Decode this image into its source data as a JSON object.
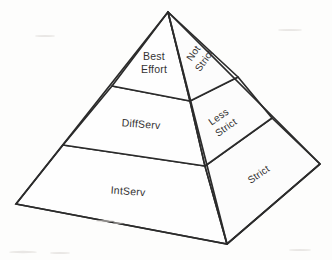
{
  "figure": {
    "background_color": "#fdfdfc",
    "line_color": "#2b2b2b",
    "text_color": "#333333"
  },
  "geometry": {
    "apex": [
      168,
      12
    ],
    "left_base_corner": [
      16,
      204
    ],
    "front_base_corner": [
      227,
      244
    ],
    "right_base_corner": [
      320,
      164
    ],
    "left_face_divider_upper": [
      [
        112,
        86
      ],
      [
        190,
        101
      ]
    ],
    "left_face_divider_lower": [
      [
        63,
        145
      ],
      [
        205,
        166
      ]
    ],
    "right_face_divider_upper": [
      [
        190,
        101
      ],
      [
        238,
        77
      ]
    ],
    "right_face_divider_lower": [
      [
        205,
        166
      ],
      [
        272,
        118
      ]
    ]
  },
  "left_face": {
    "name": "service-model-face",
    "bands": [
      {
        "id": "best-effort",
        "label": "Best Effort",
        "line1": "Best",
        "line2": "Effort",
        "level": "top"
      },
      {
        "id": "diffserv",
        "label": "DiffServ",
        "line1": "DiffServ",
        "line2": "",
        "level": "middle"
      },
      {
        "id": "intserv",
        "label": "IntServ",
        "line1": "IntServ",
        "line2": "",
        "level": "bottom"
      }
    ]
  },
  "right_face": {
    "name": "strictness-face",
    "bands": [
      {
        "id": "not-strict",
        "label": "Not Strict",
        "line1": "Not",
        "line2": "Strict",
        "level": "top",
        "rotation": -55
      },
      {
        "id": "less-strict",
        "label": "Less Strict",
        "line1": "Less",
        "line2": "Strict",
        "level": "middle",
        "rotation": -35
      },
      {
        "id": "strict",
        "label": "Strict",
        "line1": "Strict",
        "line2": "",
        "level": "bottom",
        "rotation": -35
      }
    ]
  }
}
